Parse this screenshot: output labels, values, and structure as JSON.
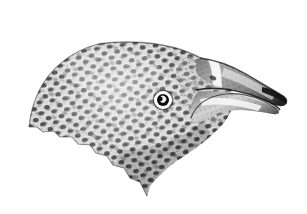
{
  "image": {
    "kind": "natural-history-illustration",
    "subject": "bird-head",
    "technique": "stipple-engraving",
    "orientation": "right-facing profile",
    "width_px": 307,
    "height_px": 214,
    "background_color": "#ffffff",
    "ink_color": "#1a1a1a",
    "midtone_color": "#6e6e6e",
    "highlight_color": "#f2f2f2",
    "alt_text": "Black and white stipple engraving of a bird head in right-facing profile with heavily spotted scaled plumage, a pale eye ring, and a short hooked beak."
  },
  "parts": {
    "crown": {
      "name": "crown",
      "label": "Crown",
      "texture": "dense dark rounded spots on mottled gray ground"
    },
    "nape": {
      "name": "nape",
      "label": "Nape",
      "texture": "ragged feather edge at lower left"
    },
    "cheek": {
      "name": "cheek",
      "label": "Cheek",
      "texture": "scalloped spotting"
    },
    "throat": {
      "name": "throat",
      "label": "Throat",
      "texture": "tapering point toward chin"
    },
    "eye": {
      "name": "eye",
      "label": "Eye",
      "center_x": 163,
      "center_y": 100,
      "ring_outer_radius": 9,
      "ring_color": "#ffffff",
      "pupil_radius": 4.6,
      "pupil_color": "#111111",
      "highlight_color": "#ffffff"
    },
    "upper_beak": {
      "name": "upper-beak",
      "label": "Upper mandible",
      "tip_x": 286,
      "tip_y": 106,
      "note": "hooked tip curving downward"
    },
    "lower_beak": {
      "name": "lower-beak",
      "label": "Lower mandible",
      "note": "pale band along cutting edge"
    },
    "beak_stripe": {
      "name": "beak-stripe",
      "label": "Pale diagonal stripe at beak base",
      "color": "#fdfdfd"
    },
    "nostril": {
      "name": "nostril",
      "label": "Nostril"
    }
  },
  "figure": {
    "title": "",
    "caption": "",
    "credit": ""
  }
}
